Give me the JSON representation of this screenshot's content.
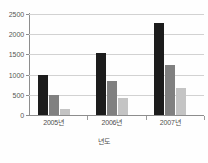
{
  "chart_data": {
    "type": "bar",
    "title": "",
    "subtitle": "",
    "xlabel": "년도",
    "ylabel": "",
    "categories": [
      "2005년",
      "2006년",
      "2007년"
    ],
    "series": [
      {
        "name": "series-1",
        "color": "#1c1c1c",
        "values": [
          1000,
          1540,
          2270
        ]
      },
      {
        "name": "series-2",
        "color": "#808080",
        "values": [
          495,
          830,
          1230
        ]
      },
      {
        "name": "series-3",
        "color": "#c4c4c4",
        "values": [
          140,
          410,
          670
        ]
      }
    ],
    "ylim": [
      0,
      2500
    ],
    "yticks": [
      0,
      500,
      1000,
      1500,
      2000,
      2500
    ],
    "ytick_labels": [
      "0",
      "500",
      "1000",
      "1500",
      "2000",
      "2500"
    ],
    "grid": true,
    "grid_axis": "y",
    "legend": false,
    "legend_position": "none",
    "background_color": "#ffffff",
    "axis_color": "#8d8d8d",
    "grid_color": "#d2d2d2"
  }
}
